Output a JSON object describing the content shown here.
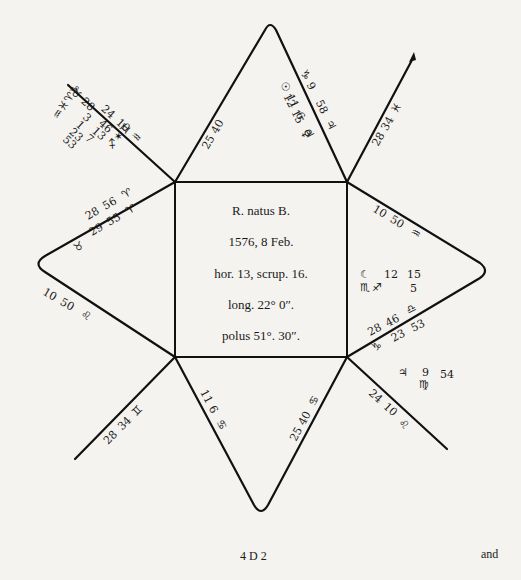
{
  "chart": {
    "center": {
      "line1": "R. natus B.",
      "line2": "1576, 8 Feb.",
      "line3": "hor. 13, scrup. 16.",
      "line4": "long. 22° 0″.",
      "line5": "polus 51°. 30″."
    },
    "houses": {
      "top_left_edge": {
        "deg": "25",
        "min": "40"
      },
      "top_right_edge": {
        "sign1": "♑",
        "deg1": "9",
        "min1": "58",
        "sign2": "♃"
      },
      "top_inner": {
        "planet1": "☉",
        "deg1": "11",
        "min1": "",
        "planet2": "",
        "deg2": "12",
        "min2": "15",
        "extra": "6",
        "sym": "♃",
        "sym2": "♀"
      },
      "upper_right_spike": {
        "deg": "28",
        "min": "34",
        "sign": "♓"
      },
      "upper_left_spike": {
        "signs": [
          "♉",
          "♑",
          "♒",
          "♓",
          "♈"
        ],
        "line_a": [
          "28",
          "24",
          "10",
          "♒"
        ],
        "line_b": [
          "3",
          "46"
        ],
        "line_c": [
          "1",
          "13"
        ],
        "line_d": [
          "23",
          "7"
        ],
        "line_e": [
          "53"
        ],
        "tail_signs": [
          "♐",
          "✶",
          "♊"
        ]
      },
      "left_upper_edge": {
        "deg1": "28",
        "min1": "56",
        "sign1": "♈",
        "deg2": "29",
        "min2": "55",
        "sign2": "♈",
        "sign3": "♉"
      },
      "left_lower_edge": {
        "deg": "10",
        "min": "50",
        "sign": "♌"
      },
      "right_upper_edge": {
        "deg": "10",
        "min": "50",
        "sign": "♒"
      },
      "right_inner": {
        "planet": "☾",
        "deg": "12",
        "min": "15",
        "sign": "♏",
        "sign2": "♐",
        "extra": "5"
      },
      "right_lower_edge": {
        "deg1": "28",
        "min1": "46",
        "sign1": "♎",
        "deg2": "23",
        "min2": "53",
        "sign2": "♑"
      },
      "lower_right_inner": {
        "planet": "♃",
        "deg": "9",
        "min": "54",
        "sign": "♍"
      },
      "lower_right_spike": {
        "deg": "24",
        "min": "10",
        "sign": "♌"
      },
      "bottom_left_edge": {
        "deg": "11",
        "min": "6",
        "sign": "♋"
      },
      "bottom_right_edge": {
        "deg": "25",
        "min": "40",
        "sign": "♋"
      },
      "lower_left_spike": {
        "deg": "28",
        "min": "34",
        "sign": "♊"
      }
    }
  },
  "footer": {
    "signature": "4 D 2",
    "catchword": "and"
  }
}
